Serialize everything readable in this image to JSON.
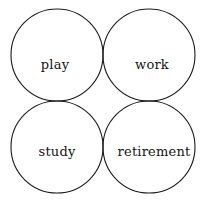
{
  "diagram": {
    "type": "venn-four-circle",
    "title": "",
    "background_color": "#ffffff",
    "stroke_color": "#1a1a1a",
    "stroke_width": 1.1,
    "label_color": "#141414",
    "circle_radius": 46,
    "canvas": {
      "width": 207,
      "height": 202
    },
    "sets": [
      {
        "id": "play",
        "label": "play",
        "center_x": 57,
        "center_y": 55,
        "label_x": 55,
        "label_y": 65
      },
      {
        "id": "work",
        "label": "work",
        "center_x": 149,
        "center_y": 55,
        "label_x": 152,
        "label_y": 65
      },
      {
        "id": "study",
        "label": "study",
        "center_x": 57,
        "center_y": 147,
        "label_x": 57,
        "label_y": 152
      },
      {
        "id": "retirement",
        "label": "retirement",
        "center_x": 149,
        "center_y": 147,
        "label_x": 154,
        "label_y": 152
      }
    ]
  }
}
